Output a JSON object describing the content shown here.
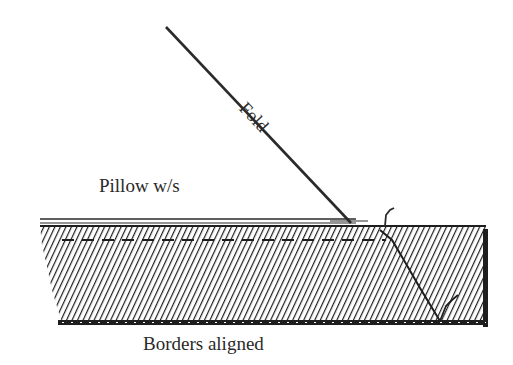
{
  "diagram": {
    "labels": {
      "fold": "Fold",
      "pillow": "Pillow w/s",
      "borders": "Borders aligned"
    },
    "colors": {
      "ink": "#2a2a2a",
      "background": "#ffffff"
    },
    "elements": [
      {
        "id": "fold-line",
        "type": "line",
        "from": [
          166,
          27
        ],
        "to": [
          350,
          224
        ]
      },
      {
        "id": "pillow-wrong-side-edge",
        "type": "double-line",
        "y": 221,
        "x_range": [
          40,
          356
        ]
      },
      {
        "id": "hatched-fabric",
        "type": "hatched-rect",
        "x_range": [
          40,
          485
        ],
        "y_range": [
          224,
          325
        ]
      },
      {
        "id": "stitch-line",
        "type": "dashed-line",
        "y": 240,
        "x_range": [
          62,
          385
        ]
      },
      {
        "id": "corner-fold-crease",
        "type": "dashed-diagonal",
        "from": [
          385,
          232
        ],
        "to": [
          440,
          322
        ]
      }
    ]
  }
}
